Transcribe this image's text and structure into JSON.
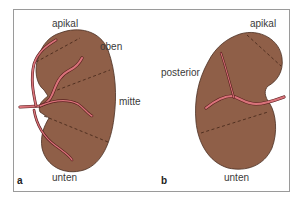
{
  "figure": {
    "colors": {
      "kidney_fill": "#8f5f48",
      "kidney_outline": "#4a2e22",
      "segment_line": "#4a2a1c",
      "vessel_fill": "#d9737a",
      "vessel_outline": "#5a1e1e",
      "frame": "#9a9a9a"
    },
    "panels": [
      {
        "letter": "a",
        "view": "anterior",
        "labels": {
          "apikal": "apikal",
          "oben": "oben",
          "mitte": "mitte",
          "unten": "unten"
        }
      },
      {
        "letter": "b",
        "view": "posterior",
        "labels": {
          "apikal": "apikal",
          "posterior": "posterior",
          "unten": "unten"
        }
      }
    ]
  }
}
